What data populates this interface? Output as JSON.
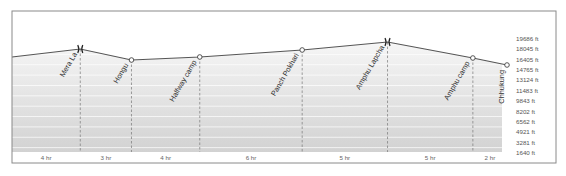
{
  "chart_data": {
    "type": "area",
    "title": "",
    "xlabel": "",
    "ylabel": "Altitude (ft)",
    "ylim": [
      1640,
      19686
    ],
    "y_unit": "ft",
    "y_ticks": [
      19686,
      18045,
      16405,
      14765,
      13124,
      11483,
      9843,
      8202,
      6562,
      4921,
      3281,
      1640
    ],
    "y_tick_labels": [
      "19686 ft",
      "18045 ft",
      "16405 ft",
      "14765 ft",
      "13124 ft",
      "11483 ft",
      "9843 ft",
      "8202 ft",
      "6562 ft",
      "4921 ft",
      "3281 ft",
      "1640 ft"
    ],
    "grid": true,
    "legend": null,
    "start_altitude_ft": 16840,
    "waypoints": [
      {
        "name": "Mera La",
        "altitude_ft": 18100,
        "marker": "pass"
      },
      {
        "name": "Hongu",
        "altitude_ft": 16360,
        "marker": "camp"
      },
      {
        "name": "Halfway camp",
        "altitude_ft": 16840,
        "marker": "camp"
      },
      {
        "name": "Panch Pokhari",
        "altitude_ft": 17950,
        "marker": "camp"
      },
      {
        "name": "Amphu Lapcha",
        "altitude_ft": 19200,
        "marker": "pass"
      },
      {
        "name": "Amphu camp",
        "altitude_ft": 16680,
        "marker": "camp"
      },
      {
        "name": "Chhukung",
        "altitude_ft": 15570,
        "marker": "camp"
      }
    ],
    "segments": [
      {
        "label": "4 hr",
        "hours": 4
      },
      {
        "label": "3 hr",
        "hours": 3
      },
      {
        "label": "4 hr",
        "hours": 4
      },
      {
        "label": "6 hr",
        "hours": 6
      },
      {
        "label": "5 hr",
        "hours": 5
      },
      {
        "label": "5 hr",
        "hours": 5
      },
      {
        "label": "2 hr",
        "hours": 2
      }
    ]
  },
  "colors": {
    "frame": "#8a8a8a",
    "profile_line": "#555555",
    "band_light": "#f3f3f3",
    "band_dark": "#d6d6d6",
    "grid_line": "#ffffff",
    "dashed": "#777777",
    "marker_fill": "#ffffff",
    "marker_stroke": "#444444"
  }
}
